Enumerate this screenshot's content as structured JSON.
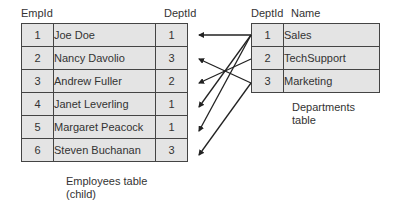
{
  "employees": {
    "headers": {
      "empid": "EmpId",
      "deptid": "DeptId"
    },
    "rows": [
      {
        "empid": "1",
        "name": "Joe Doe",
        "deptid": "1"
      },
      {
        "empid": "2",
        "name": "Nancy Davolio",
        "deptid": "3"
      },
      {
        "empid": "3",
        "name": "Andrew Fuller",
        "deptid": "2"
      },
      {
        "empid": "4",
        "name": "Janet Leverling",
        "deptid": "1"
      },
      {
        "empid": "5",
        "name": "Margaret Peacock",
        "deptid": "1"
      },
      {
        "empid": "6",
        "name": "Steven Buchanan",
        "deptid": "3"
      }
    ],
    "caption_line1": "Employees table",
    "caption_line2": "(child)"
  },
  "departments": {
    "headers": {
      "deptid": "DeptId",
      "name": "Name"
    },
    "rows": [
      {
        "deptid": "1",
        "name": "Sales"
      },
      {
        "deptid": "2",
        "name": "TechSupport"
      },
      {
        "deptid": "3",
        "name": "Marketing"
      }
    ],
    "caption_line1": "Departments",
    "caption_line2": "table"
  },
  "relationships": [
    {
      "from_dept_row": 1,
      "to_emp_row": 1
    },
    {
      "from_dept_row": 1,
      "to_emp_row": 4
    },
    {
      "from_dept_row": 1,
      "to_emp_row": 5
    },
    {
      "from_dept_row": 2,
      "to_emp_row": 3
    },
    {
      "from_dept_row": 3,
      "to_emp_row": 2
    },
    {
      "from_dept_row": 3,
      "to_emp_row": 6
    }
  ],
  "colors": {
    "cell_fill": "#e4e4e4",
    "border": "#444444",
    "arrow": "#222222"
  }
}
